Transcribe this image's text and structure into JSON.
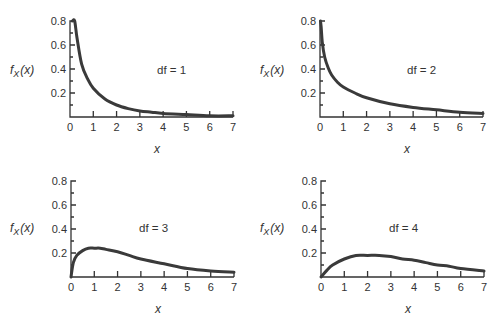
{
  "figure": {
    "y_label": "f",
    "y_label_sub": "X",
    "y_label_arg": "(x)",
    "x_label": "x"
  },
  "chart_data": [
    {
      "type": "line",
      "title": "df = 1",
      "xlabel": "x",
      "ylabel": "f_X(x)",
      "xlim": [
        0,
        7
      ],
      "ylim": [
        0,
        0.8
      ],
      "x_ticks": [
        "0",
        "1",
        "2",
        "3",
        "4",
        "5",
        "6",
        "7"
      ],
      "y_ticks": [
        "0.2",
        "0.4",
        "0.6",
        "0.8"
      ],
      "grid": false,
      "x": [
        0.1,
        0.2,
        0.3,
        0.5,
        0.75,
        1,
        1.5,
        2,
        2.5,
        3,
        3.5,
        4,
        5,
        6,
        7
      ],
      "values": [
        0.8,
        0.8,
        0.66,
        0.44,
        0.32,
        0.24,
        0.15,
        0.1,
        0.07,
        0.05,
        0.04,
        0.03,
        0.02,
        0.01,
        0.01
      ]
    },
    {
      "type": "line",
      "title": "df = 2",
      "xlabel": "x",
      "ylabel": "f_X(x)",
      "xlim": [
        0,
        7
      ],
      "ylim": [
        0,
        0.8
      ],
      "x_ticks": [
        "0",
        "1",
        "2",
        "3",
        "4",
        "5",
        "6",
        "7"
      ],
      "y_ticks": [
        "0.2",
        "0.4",
        "0.6",
        "0.8"
      ],
      "grid": false,
      "x": [
        0.02,
        0.05,
        0.1,
        0.2,
        0.35,
        0.5,
        0.75,
        1,
        1.5,
        2,
        3,
        4,
        5,
        6,
        7
      ],
      "values": [
        0.8,
        0.75,
        0.62,
        0.5,
        0.41,
        0.35,
        0.29,
        0.25,
        0.2,
        0.16,
        0.11,
        0.08,
        0.06,
        0.04,
        0.03
      ]
    },
    {
      "type": "line",
      "title": "df = 3",
      "xlabel": "x",
      "ylabel": "f_X(x)",
      "xlim": [
        0,
        7
      ],
      "ylim": [
        0,
        0.8
      ],
      "x_ticks": [
        "0",
        "1",
        "2",
        "3",
        "4",
        "5",
        "6",
        "7"
      ],
      "y_ticks": [
        "0.2",
        "0.4",
        "0.6",
        "0.8"
      ],
      "grid": false,
      "x": [
        0,
        0.1,
        0.25,
        0.5,
        0.75,
        1,
        1.25,
        1.5,
        2,
        2.5,
        3,
        4,
        5,
        6,
        7
      ],
      "values": [
        0,
        0.12,
        0.18,
        0.22,
        0.24,
        0.24,
        0.24,
        0.23,
        0.21,
        0.18,
        0.15,
        0.11,
        0.07,
        0.05,
        0.04
      ]
    },
    {
      "type": "line",
      "title": "df = 4",
      "xlabel": "x",
      "ylabel": "f_X(x)",
      "xlim": [
        0,
        7
      ],
      "ylim": [
        0,
        0.8
      ],
      "x_ticks": [
        "0",
        "1",
        "2",
        "3",
        "4",
        "5",
        "6",
        "7"
      ],
      "y_ticks": [
        "0.2",
        "0.4",
        "0.6",
        "0.8"
      ],
      "grid": false,
      "x": [
        0,
        0.25,
        0.5,
        1,
        1.5,
        2,
        2.5,
        3,
        3.5,
        4,
        4.5,
        5,
        5.5,
        6,
        7
      ],
      "values": [
        0,
        0.055,
        0.1,
        0.15,
        0.18,
        0.18,
        0.18,
        0.17,
        0.15,
        0.14,
        0.12,
        0.1,
        0.09,
        0.07,
        0.05
      ]
    }
  ],
  "panels": [
    {
      "df_label": "df = 1"
    },
    {
      "df_label": "df = 2"
    },
    {
      "df_label": "df = 3"
    },
    {
      "df_label": "df = 4"
    }
  ]
}
